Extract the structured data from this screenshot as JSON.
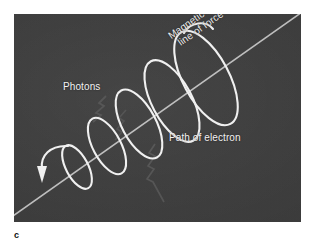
{
  "figure": {
    "letter": "c",
    "panel": {
      "background_color": "#3c3c3c",
      "stroke_color": "#f0f0f0",
      "field_line_color": "#c9c9c9",
      "photon_color": "#8d8d8d"
    },
    "labels": {
      "photons": "Photons",
      "path_of_electron": "Path of electron",
      "magnetic_line_1": "Magnetic",
      "magnetic_line_2": "line of force"
    },
    "elements": {
      "field_line": "magnetic-field-line",
      "helix": "electron-helical-path",
      "arrow": "direction-arrowhead",
      "photon_emissions": "photon-zigzag-rays"
    }
  }
}
